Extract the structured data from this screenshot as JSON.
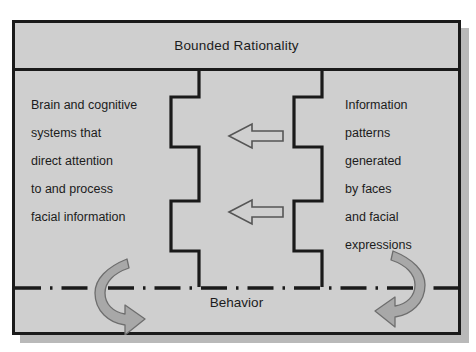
{
  "diagram": {
    "title": "Bounded Rationality",
    "footer_label": "Behavior",
    "left_block": {
      "name": "brain-and-cognitive-systems",
      "lines": [
        "Brain and cognitive",
        "systems that",
        "direct attention",
        "to and process",
        "facial information"
      ]
    },
    "right_block": {
      "name": "information-patterns",
      "lines": [
        "Information",
        "patterns",
        "generated",
        "by faces",
        "and facial",
        "expressions"
      ]
    },
    "arrows": {
      "straight": [
        {
          "name": "upper-leftward-arrow",
          "direction": "left"
        },
        {
          "name": "lower-leftward-arrow",
          "direction": "left"
        }
      ],
      "curved": [
        {
          "name": "left-feedback-curved-arrow",
          "direction": "counter-clockwise"
        },
        {
          "name": "right-feedback-curved-arrow",
          "direction": "clockwise"
        }
      ]
    },
    "separator": {
      "name": "behavior-dash-dot-separator",
      "style": "dash-dot"
    },
    "colors": {
      "panel_fill": "#cfcfcf",
      "outline": "#1a1a1a",
      "shadow": "#b9b9b9",
      "curved_arrow_fill": "#a8a8a8",
      "curved_arrow_outline": "#6e6e6e",
      "straight_arrow_fill": "#cfcfcf",
      "straight_arrow_outline": "#555555",
      "text": "#1c1c1c"
    }
  }
}
